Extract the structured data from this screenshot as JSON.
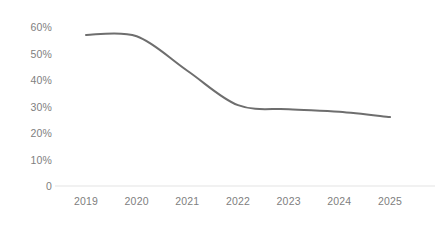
{
  "chart_data": {
    "type": "line",
    "title": "",
    "subtitle": "",
    "xlabel": "",
    "ylabel": "",
    "categories": [
      "2019",
      "2020",
      "2021",
      "2022",
      "2023",
      "2024",
      "2025"
    ],
    "x": [
      2019,
      2020,
      2021,
      2022,
      2023,
      2024,
      2025
    ],
    "series": [
      {
        "name": "",
        "values": [
          57,
          56.5,
          43.5,
          30.5,
          29,
          28,
          26
        ],
        "color": "#6e6e6e"
      }
    ],
    "values": [
      57,
      56.5,
      43.5,
      30.5,
      29,
      28,
      26
    ],
    "ylim": [
      0,
      63
    ],
    "xlim": [
      2019,
      2025
    ],
    "y_ticks": [
      0,
      10,
      20,
      30,
      40,
      50,
      60
    ],
    "y_tick_labels": [
      "0",
      "10%",
      "20%",
      "30%",
      "40%",
      "50%",
      "60%"
    ],
    "x_ticks": [
      2019,
      2020,
      2021,
      2022,
      2023,
      2024,
      2025
    ],
    "x_tick_labels": [
      "2019",
      "2020",
      "2021",
      "2022",
      "2023",
      "2024",
      "2025"
    ],
    "grid": false,
    "legend": false,
    "legend_position": "none",
    "annotations": [],
    "axis_color": "#ededed",
    "tick_label_color": "#808080",
    "background_color": "#ffffff",
    "smoothing": "monotone-spline"
  }
}
